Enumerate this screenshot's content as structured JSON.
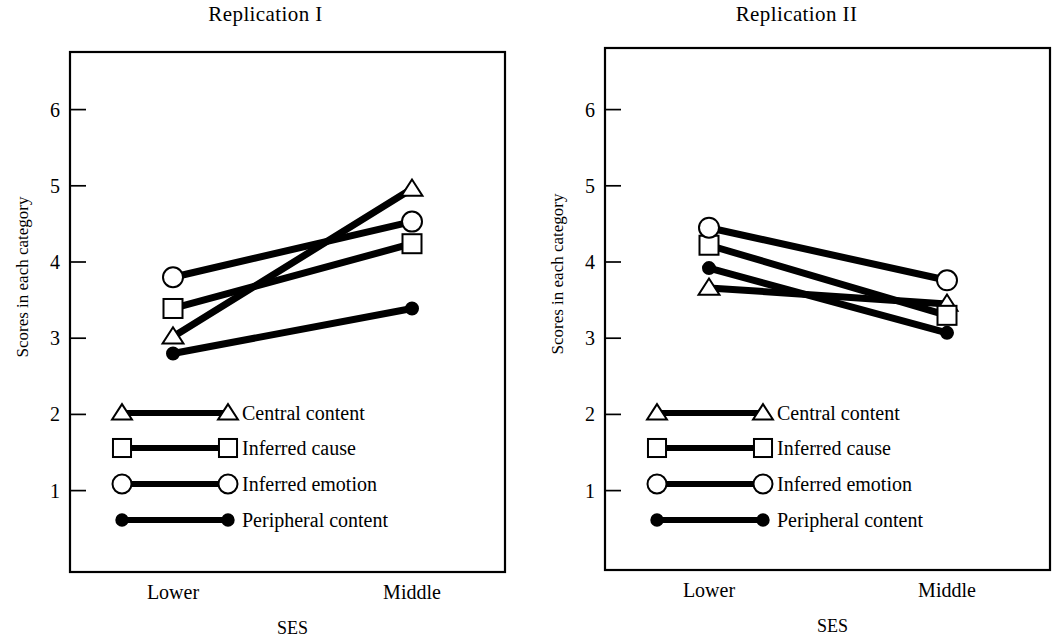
{
  "figure": {
    "background": "#ffffff",
    "ink": "#000000",
    "width": 1063,
    "height": 642
  },
  "panels": [
    {
      "key": "replication-1",
      "title": "Replication I",
      "ylabel": "Scores in each category",
      "xlabel": "SES",
      "categories": [
        "Lower",
        "Middle"
      ],
      "yticks": [
        "6",
        "5",
        "4",
        "3",
        "2",
        "1"
      ]
    },
    {
      "key": "replication-2",
      "title": "Replication II",
      "ylabel": "Scores in each category",
      "xlabel": "SES",
      "categories": [
        "Lower",
        "Middle"
      ],
      "yticks": [
        "6",
        "5",
        "4",
        "3",
        "2",
        "1"
      ]
    }
  ],
  "legend": {
    "entries": [
      {
        "label": "Central content",
        "marker": "triangle-open"
      },
      {
        "label": "Inferred cause",
        "marker": "square-open"
      },
      {
        "label": "Inferred emotion",
        "marker": "circle-open"
      },
      {
        "label": "Peripheral content",
        "marker": "circle-filled"
      }
    ]
  },
  "chart_data": [
    {
      "type": "line",
      "title": "Replication I",
      "xlabel": "SES",
      "ylabel": "Scores in each category",
      "categories": [
        "Lower",
        "Middle"
      ],
      "ylim": [
        0.45,
        6.6
      ],
      "yticks": [
        1,
        2,
        3,
        4,
        5,
        6
      ],
      "grid": false,
      "legend_position": "inside-lower-left",
      "series": [
        {
          "name": "Central content",
          "marker": "triangle-open",
          "values": [
            3.02,
            4.96
          ]
        },
        {
          "name": "Inferred cause",
          "marker": "square-open",
          "values": [
            3.39,
            4.24
          ]
        },
        {
          "name": "Inferred emotion",
          "marker": "circle-open",
          "values": [
            3.8,
            4.53
          ]
        },
        {
          "name": "Peripheral content",
          "marker": "circle-filled",
          "values": [
            2.8,
            3.39
          ]
        }
      ]
    },
    {
      "type": "line",
      "title": "Replication II",
      "xlabel": "SES",
      "ylabel": "Scores in each category",
      "categories": [
        "Lower",
        "Middle"
      ],
      "ylim": [
        0.45,
        6.6
      ],
      "yticks": [
        1,
        2,
        3,
        4,
        5,
        6
      ],
      "grid": false,
      "legend_position": "inside-lower-left",
      "series": [
        {
          "name": "Central content",
          "marker": "triangle-open",
          "values": [
            3.66,
            3.45
          ]
        },
        {
          "name": "Inferred cause",
          "marker": "square-open",
          "values": [
            4.22,
            3.3
          ]
        },
        {
          "name": "Inferred emotion",
          "marker": "circle-open",
          "values": [
            4.45,
            3.76
          ]
        },
        {
          "name": "Peripheral content",
          "marker": "circle-filled",
          "values": [
            3.92,
            3.07
          ]
        }
      ]
    }
  ]
}
